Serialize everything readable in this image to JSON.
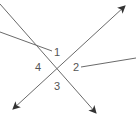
{
  "diagram": {
    "type": "intersecting-lines-angles",
    "stroke_color": "#6a6a6a",
    "label_color": "#555555",
    "labels": [
      {
        "id": "angle-1",
        "text": "1"
      },
      {
        "id": "angle-2",
        "text": "2"
      },
      {
        "id": "angle-3",
        "text": "3"
      },
      {
        "id": "angle-4",
        "text": "4"
      }
    ]
  }
}
